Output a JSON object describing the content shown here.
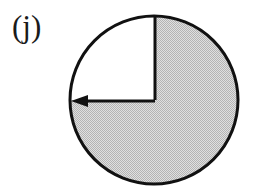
{
  "figure": {
    "panel_label": "(j)",
    "background_color": "#ffffff"
  },
  "diagram": {
    "circle": {
      "name": "circle-outline",
      "center_x": 154,
      "center_y": 100,
      "radius": 85,
      "stroke_color": "#111111",
      "stroke_width": 3,
      "fill_color": "#ffffff"
    },
    "shaded_sector": {
      "name": "shaded-sector",
      "fill_color": "#cccccc",
      "start_angle_deg": 270,
      "sweep_deg": 270,
      "description": "three-quarter sector shaded from top clockwise to left"
    },
    "unshaded_sector": {
      "name": "unshaded-quadrant",
      "fill_color": "#ffffff",
      "start_angle_deg": 180,
      "sweep_deg": 90,
      "description": "upper-left quadrant left white"
    },
    "radius_vertical": {
      "name": "radius-vertical",
      "x1": 155,
      "y1": 100,
      "x2": 155,
      "y2": 16,
      "stroke_color": "#111111",
      "stroke_width": 3
    },
    "radius_horizontal": {
      "name": "radius-horizontal-arrow",
      "x1": 155,
      "y1": 101,
      "x2": 72,
      "y2": 101,
      "stroke_color": "#111111",
      "stroke_width": 3,
      "arrowhead": "left"
    },
    "arrowhead": {
      "name": "arrowhead-left",
      "tip_x": 71,
      "tip_y": 101,
      "length": 17,
      "half_width": 6,
      "fill_color": "#111111"
    }
  }
}
